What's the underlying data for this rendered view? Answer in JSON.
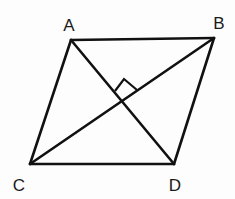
{
  "diagram": {
    "type": "rhombus-with-diagonals",
    "stroke_color": "#111111",
    "vertices": [
      {
        "id": "A",
        "label": "A",
        "x": 71,
        "y": 40,
        "label_x": 69,
        "label_y": 31
      },
      {
        "id": "B",
        "label": "B",
        "x": 214,
        "y": 38,
        "label_x": 219,
        "label_y": 29
      },
      {
        "id": "C",
        "label": "C",
        "x": 30,
        "y": 164,
        "label_x": 19,
        "label_y": 191
      },
      {
        "id": "D",
        "label": "D",
        "x": 174,
        "y": 164,
        "label_x": 175,
        "label_y": 191
      }
    ],
    "edges": [
      [
        "A",
        "B"
      ],
      [
        "B",
        "D"
      ],
      [
        "D",
        "C"
      ],
      [
        "C",
        "A"
      ]
    ],
    "diagonals": [
      [
        "A",
        "D"
      ],
      [
        "B",
        "C"
      ]
    ],
    "right_angle_marker": {
      "at": "intersection",
      "intersection": {
        "x": 123,
        "y": 104
      },
      "points": "115,91 124,79 137,90"
    }
  }
}
